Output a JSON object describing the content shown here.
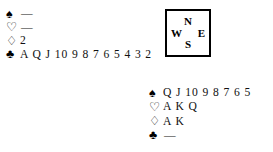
{
  "diagram": {
    "type": "bridge-hand-diagram",
    "background_color": "#ffffff",
    "ink_color": "#111111"
  },
  "suits": {
    "spade_symbol": "♠",
    "heart_symbol": "♡",
    "diamond_symbol": "♢",
    "club_symbol": "♣",
    "void_mark": "—"
  },
  "compass": {
    "north": "N",
    "south": "S",
    "east": "E",
    "west": "W",
    "border_color": "#000000"
  },
  "hands": {
    "west": {
      "position": "West",
      "spades": "—",
      "hearts": "—",
      "diamonds": "2",
      "clubs": "A Q J 10 9 8 7 6 5 4 3 2"
    },
    "south": {
      "position": "South",
      "spades": "Q J 10 9 8 7 6 5",
      "hearts": "A K Q",
      "diamonds": "A K",
      "clubs": "—"
    }
  }
}
